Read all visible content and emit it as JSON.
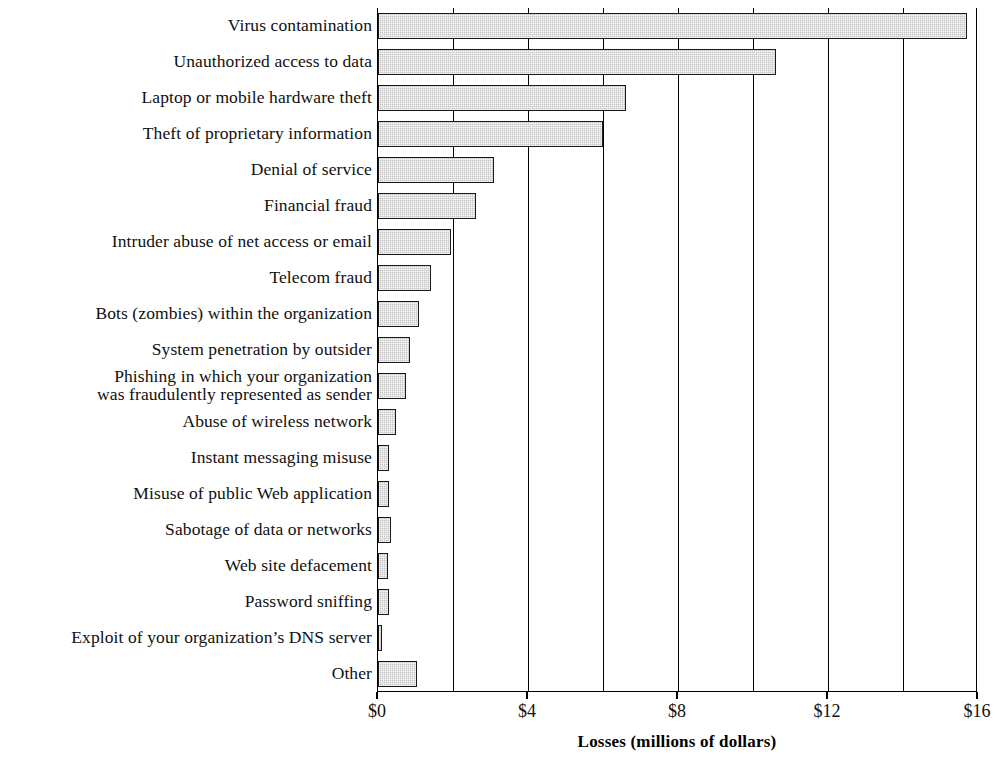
{
  "chart_data": {
    "type": "bar",
    "orientation": "horizontal",
    "title": "",
    "xlabel": "Losses (millions of dollars)",
    "ylabel": "",
    "xlim": [
      0,
      16
    ],
    "xticks": [
      0,
      4,
      8,
      12,
      16
    ],
    "xtick_labels": [
      "$0",
      "$4",
      "$8",
      "$12",
      "$16"
    ],
    "gridlines_every": 2,
    "grid": true,
    "legend": "none",
    "bar_fill_color": "#c4c4c4",
    "bar_border_color": "#1a1a1a",
    "categories": [
      "Virus contamination",
      "Unauthorized access to data",
      "Laptop or mobile hardware theft",
      "Theft of proprietary information",
      "Denial of service",
      "Financial fraud",
      "Intruder abuse of net access or email",
      "Telecom fraud",
      "Bots (zombies) within the organization",
      "System penetration by outsider",
      "Phishing in which your organization\nwas fraudulently represented as sender",
      "Abuse of wireless network",
      "Instant messaging misuse",
      "Misuse of public Web application",
      "Sabotage of data or networks",
      "Web site defacement",
      "Password sniffing",
      "Exploit of your organization’s DNS server",
      "Other"
    ],
    "values": [
      15.7,
      10.6,
      6.6,
      6.0,
      3.1,
      2.6,
      1.95,
      1.4,
      1.1,
      0.86,
      0.75,
      0.47,
      0.3,
      0.29,
      0.34,
      0.26,
      0.28,
      0.09,
      1.05
    ]
  }
}
